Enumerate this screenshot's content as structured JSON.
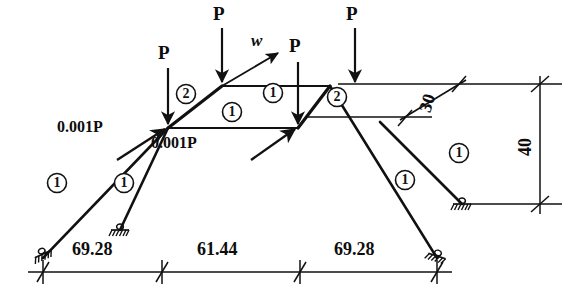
{
  "figure": {
    "type": "structural-truss-diagram",
    "title": "",
    "ink_color": "#111111",
    "background": "#ffffff"
  },
  "loads": {
    "vertical_point_loads": [
      {
        "id": "P-left",
        "label": "P",
        "label_x": 160,
        "label_y": 52,
        "tip_x": 168,
        "tip_y": 126,
        "tail_x": 168,
        "tail_y": 68
      },
      {
        "id": "P-mid-left",
        "label": "P",
        "label_x": 215,
        "label_y": 12,
        "tip_x": 222,
        "tip_y": 84,
        "tail_x": 222,
        "tail_y": 28
      },
      {
        "id": "P-mid-right",
        "label": "P",
        "label_x": 290,
        "label_y": 45,
        "tip_x": 298,
        "tip_y": 126,
        "tail_x": 298,
        "tail_y": 62
      },
      {
        "id": "P-right",
        "label": "P",
        "label_x": 348,
        "label_y": 12,
        "tip_x": 355,
        "tip_y": 84,
        "tail_x": 355,
        "tail_y": 28
      }
    ],
    "inclined_loads": [
      {
        "id": "w-load",
        "label": "w",
        "label_x": 254,
        "label_y": 38,
        "tail_x": 222,
        "tail_y": 86,
        "tip_x": 281,
        "tip_y": 52
      },
      {
        "id": "imperf-left",
        "label": "0.001P",
        "label_x": 76,
        "label_y": 127,
        "tail_x": 117,
        "tail_y": 160,
        "tip_x": 168,
        "tip_y": 128
      },
      {
        "id": "imperf-right",
        "label": "0.001P",
        "label_x": 153,
        "label_y": 142,
        "tail_x": 251,
        "tail_y": 160,
        "tip_x": 298,
        "tip_y": 128
      }
    ]
  },
  "members": [
    {
      "id": "m1",
      "tag": "1",
      "cx": 57,
      "cy": 183
    },
    {
      "id": "m2",
      "tag": "1",
      "cx": 124,
      "cy": 183
    },
    {
      "id": "m3",
      "tag": "2",
      "cx": 186,
      "cy": 94
    },
    {
      "id": "m4",
      "tag": "1",
      "cx": 232,
      "cy": 112
    },
    {
      "id": "m5",
      "tag": "1",
      "cx": 273,
      "cy": 93
    },
    {
      "id": "m6",
      "tag": "2",
      "cx": 337,
      "cy": 97
    },
    {
      "id": "m7",
      "tag": "1",
      "cx": 405,
      "cy": 180
    },
    {
      "id": "m8",
      "tag": "1",
      "cx": 459,
      "cy": 153
    }
  ],
  "nodes": [
    {
      "id": "n-upper-left",
      "x": 222,
      "y": 86
    },
    {
      "id": "n-upper-right",
      "x": 330,
      "y": 86
    },
    {
      "id": "n-lower-left",
      "x": 168,
      "y": 128
    },
    {
      "id": "n-lower-right",
      "x": 298,
      "y": 128
    }
  ],
  "supports": [
    {
      "id": "support-far-left",
      "type": "pinned-hatched",
      "x": 43,
      "y": 258,
      "rotation": -24
    },
    {
      "id": "support-inner-left",
      "type": "pinned-hatched",
      "x": 120,
      "y": 230,
      "rotation": 0
    },
    {
      "id": "support-far-right",
      "type": "pinned-hatched",
      "x": 437,
      "y": 258,
      "rotation": 20
    },
    {
      "id": "support-inner-right",
      "type": "pinned-hatched",
      "x": 462,
      "y": 204,
      "rotation": 0
    }
  ],
  "dimensions": {
    "baseline": {
      "y": 272,
      "x_start": 43,
      "x_end": 437,
      "ticks": [
        43,
        162,
        300,
        437
      ],
      "segments": [
        {
          "label": "69.28",
          "label_x": 72,
          "label_y": 248
        },
        {
          "label": "61.44",
          "label_x": 197,
          "label_y": 248
        },
        {
          "label": "69.28",
          "label_x": 334,
          "label_y": 248
        }
      ]
    },
    "diagonal": {
      "label": "30",
      "label_x": 425,
      "label_y": 103,
      "rotation": -72,
      "from_x": 405,
      "from_y": 117,
      "to_x": 462,
      "to_y": 84,
      "ext_upper": {
        "x1": 338,
        "y1": 84,
        "x2": 500,
        "y2": 84
      },
      "ext_lower": {
        "x1": 305,
        "y1": 117,
        "x2": 430,
        "y2": 117
      }
    },
    "vertical": {
      "label": "40",
      "label_x": 523,
      "label_y": 148,
      "rotation": -90,
      "x": 540,
      "y_top": 84,
      "y_bottom": 204,
      "ext_top": {
        "x1": 500,
        "y1": 84,
        "x2": 560,
        "y2": 84
      },
      "ext_bottom": {
        "x1": 470,
        "y1": 204,
        "x2": 560,
        "y2": 204
      }
    }
  }
}
